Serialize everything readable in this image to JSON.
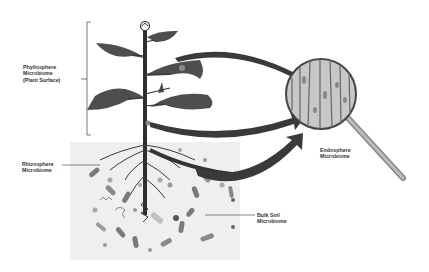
{
  "diagram": {
    "labels": {
      "phyllosphere": {
        "line1": "Phyllosphere",
        "line2": "Microbiome",
        "line3": "(Plant Surface)"
      },
      "rhizosphere": {
        "line1": "Rhizosphere",
        "line2": "Microbiome"
      },
      "endosphere": {
        "line1": "Endosphere",
        "line2": "Microbiome"
      },
      "bulk_soil": {
        "line1": "Bulk Soil",
        "line2": "Microbiome"
      }
    },
    "colors": {
      "plant": "#4a4a4a",
      "stem": "#2e2e2e",
      "soil_bg": "#efefef",
      "arrow": "#3a3a3a",
      "text": "#333333",
      "microbe_dark": "#7a7a7a",
      "microbe_light": "#b5b5b5"
    }
  }
}
